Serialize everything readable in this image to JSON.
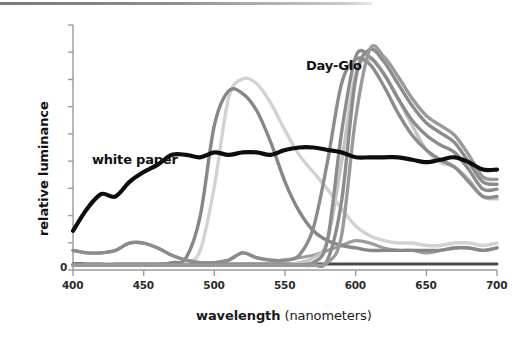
{
  "figure": {
    "top_rule_visible": true,
    "background_color": "#ffffff"
  },
  "axes": {
    "x_title_bold": "wavelength",
    "x_title_unit": "(nanometers)",
    "y_title": "relative luminance",
    "y_zero_label": "0",
    "axis_color": "#9a9a9a",
    "x_ticks": [
      "400",
      "450",
      "500",
      "550",
      "600",
      "650",
      "700"
    ]
  },
  "annotations": [
    {
      "name": "day-glo-label",
      "text": "Day-Glo",
      "x": 306,
      "y": 68
    },
    {
      "name": "white-paper-label",
      "text": "white paper",
      "x": 148,
      "y": 165
    }
  ],
  "chart_data": {
    "type": "line",
    "title": "",
    "subtitle": "",
    "xlabel": "wavelength (nanometers)",
    "ylabel": "relative luminance",
    "xlim": [
      400,
      700
    ],
    "ylim": [
      0,
      1.0
    ],
    "xticks": [
      400,
      450,
      500,
      550,
      600,
      650,
      700
    ],
    "yticks_labeled": [
      0
    ],
    "yticks_unlabeled_count": 9,
    "grid": false,
    "legend": "none (inline annotations)",
    "annotations": [
      "Day-Glo",
      "white paper"
    ],
    "x": [
      400,
      410,
      420,
      430,
      440,
      450,
      460,
      470,
      480,
      490,
      500,
      510,
      520,
      530,
      540,
      550,
      560,
      570,
      580,
      590,
      600,
      610,
      620,
      630,
      640,
      650,
      660,
      670,
      680,
      690,
      700
    ],
    "series": [
      {
        "name": "white paper",
        "color": "#0d0d0d",
        "width": 4.2,
        "values": [
          0.16,
          0.25,
          0.31,
          0.3,
          0.36,
          0.4,
          0.43,
          0.47,
          0.47,
          0.46,
          0.48,
          0.47,
          0.48,
          0.48,
          0.47,
          0.49,
          0.5,
          0.5,
          0.49,
          0.48,
          0.46,
          0.46,
          0.46,
          0.46,
          0.45,
          0.44,
          0.45,
          0.46,
          0.44,
          0.41,
          0.41
        ]
      },
      {
        "name": "day-glo-green-dark",
        "color": "#878787",
        "width": 3.4,
        "values": [
          0.02,
          0.02,
          0.02,
          0.02,
          0.02,
          0.02,
          0.02,
          0.03,
          0.05,
          0.22,
          0.59,
          0.73,
          0.72,
          0.65,
          0.52,
          0.36,
          0.24,
          0.16,
          0.12,
          0.1,
          0.09,
          0.08,
          0.08,
          0.08,
          0.08,
          0.08,
          0.08,
          0.09,
          0.09,
          0.08,
          0.09
        ]
      },
      {
        "name": "day-glo-green-light",
        "color": "#d2d2d2",
        "width": 3.4,
        "values": [
          0.02,
          0.02,
          0.02,
          0.02,
          0.02,
          0.02,
          0.02,
          0.02,
          0.03,
          0.08,
          0.34,
          0.7,
          0.78,
          0.76,
          0.68,
          0.57,
          0.47,
          0.4,
          0.33,
          0.25,
          0.18,
          0.14,
          0.12,
          0.11,
          0.11,
          0.1,
          0.1,
          0.11,
          0.11,
          0.1,
          0.11
        ]
      },
      {
        "name": "day-glo-orange-1",
        "color": "#8c8c8c",
        "width": 3.4,
        "values": [
          0.08,
          0.07,
          0.07,
          0.08,
          0.11,
          0.11,
          0.09,
          0.06,
          0.04,
          0.03,
          0.03,
          0.04,
          0.07,
          0.05,
          0.04,
          0.04,
          0.06,
          0.17,
          0.44,
          0.76,
          0.86,
          0.84,
          0.75,
          0.64,
          0.55,
          0.49,
          0.45,
          0.42,
          0.36,
          0.3,
          0.3
        ]
      },
      {
        "name": "day-glo-orange-2",
        "color": "#8c8c8c",
        "width": 3.4,
        "values": [
          0.02,
          0.02,
          0.02,
          0.02,
          0.02,
          0.02,
          0.02,
          0.02,
          0.02,
          0.02,
          0.02,
          0.02,
          0.02,
          0.02,
          0.02,
          0.02,
          0.02,
          0.03,
          0.12,
          0.56,
          0.87,
          0.87,
          0.8,
          0.7,
          0.61,
          0.55,
          0.51,
          0.48,
          0.41,
          0.33,
          0.33
        ]
      },
      {
        "name": "day-glo-red-1",
        "color": "#8c8c8c",
        "width": 3.4,
        "values": [
          0.02,
          0.02,
          0.02,
          0.02,
          0.02,
          0.02,
          0.02,
          0.02,
          0.02,
          0.02,
          0.02,
          0.02,
          0.02,
          0.02,
          0.02,
          0.02,
          0.02,
          0.02,
          0.04,
          0.28,
          0.78,
          0.9,
          0.85,
          0.76,
          0.67,
          0.6,
          0.56,
          0.52,
          0.44,
          0.36,
          0.35
        ]
      },
      {
        "name": "day-glo-red-2",
        "color": "#9a9a9a",
        "width": 3.4,
        "values": [
          0.02,
          0.02,
          0.02,
          0.02,
          0.02,
          0.02,
          0.02,
          0.02,
          0.02,
          0.02,
          0.02,
          0.02,
          0.02,
          0.02,
          0.02,
          0.02,
          0.02,
          0.02,
          0.03,
          0.14,
          0.62,
          0.9,
          0.87,
          0.79,
          0.7,
          0.63,
          0.59,
          0.55,
          0.47,
          0.38,
          0.37
        ]
      },
      {
        "name": "day-glo-yellow-tail",
        "color": "#c4c4c4",
        "width": 3.4,
        "values": [
          0.02,
          0.02,
          0.02,
          0.02,
          0.02,
          0.02,
          0.02,
          0.02,
          0.02,
          0.02,
          0.02,
          0.02,
          0.02,
          0.02,
          0.02,
          0.02,
          0.03,
          0.05,
          0.12,
          0.44,
          0.8,
          0.86,
          0.8,
          0.7,
          0.59,
          0.49,
          0.44,
          0.42,
          0.37,
          0.3,
          0.29
        ]
      },
      {
        "name": "baseline-low-grey",
        "color": "#9d9d9d",
        "width": 3.2,
        "values": [
          0.08,
          0.07,
          0.07,
          0.08,
          0.11,
          0.11,
          0.09,
          0.06,
          0.04,
          0.03,
          0.03,
          0.04,
          0.07,
          0.05,
          0.04,
          0.04,
          0.05,
          0.06,
          0.08,
          0.1,
          0.12,
          0.11,
          0.09,
          0.08,
          0.08,
          0.07,
          0.08,
          0.09,
          0.09,
          0.08,
          0.09
        ]
      },
      {
        "name": "baseline-dark",
        "color": "#4a4a4a",
        "width": 3.0,
        "values": [
          0.025,
          0.025,
          0.024,
          0.024,
          0.024,
          0.024,
          0.024,
          0.024,
          0.024,
          0.024,
          0.024,
          0.024,
          0.024,
          0.024,
          0.024,
          0.024,
          0.024,
          0.024,
          0.024,
          0.024,
          0.024,
          0.024,
          0.024,
          0.024,
          0.024,
          0.024,
          0.024,
          0.024,
          0.024,
          0.024,
          0.024
        ]
      }
    ]
  }
}
